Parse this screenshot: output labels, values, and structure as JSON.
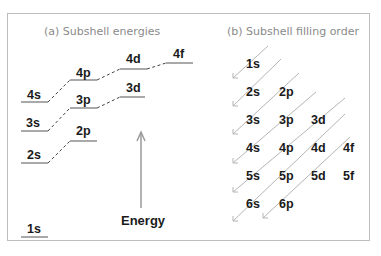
{
  "panel_a": {
    "title": "(a) Subshell energies",
    "axis_label": "Energy",
    "levels": [
      {
        "label": "1s",
        "x": 22,
        "y": 234
      },
      {
        "label": "2s",
        "x": 22,
        "y": 163
      },
      {
        "label": "2p",
        "x": 72,
        "y": 141
      },
      {
        "label": "3s",
        "x": 22,
        "y": 131
      },
      {
        "label": "3p",
        "x": 72,
        "y": 108
      },
      {
        "label": "3d",
        "x": 120,
        "y": 97
      },
      {
        "label": "4s",
        "x": 22,
        "y": 102
      },
      {
        "label": "4p",
        "x": 72,
        "y": 80
      },
      {
        "label": "4d",
        "x": 120,
        "y": 69
      },
      {
        "label": "4f",
        "x": 167,
        "y": 63
      }
    ]
  },
  "panel_b": {
    "title": "(b) Subshell filling order",
    "rows": [
      [
        "1s"
      ],
      [
        "2s",
        "2p"
      ],
      [
        "3s",
        "3p",
        "3d"
      ],
      [
        "4s",
        "4p",
        "4d",
        "4f"
      ],
      [
        "5s",
        "5p",
        "5d",
        "5f"
      ],
      [
        "6s",
        "6p"
      ]
    ]
  }
}
